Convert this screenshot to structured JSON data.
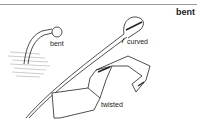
{
  "entry": {
    "headword": "bent"
  },
  "illustration": {
    "labels": {
      "bent": "bent",
      "curved": "curved",
      "twisted": "twisted"
    },
    "items": [
      "bent nail",
      "curved sword",
      "twisted ribbon"
    ]
  }
}
